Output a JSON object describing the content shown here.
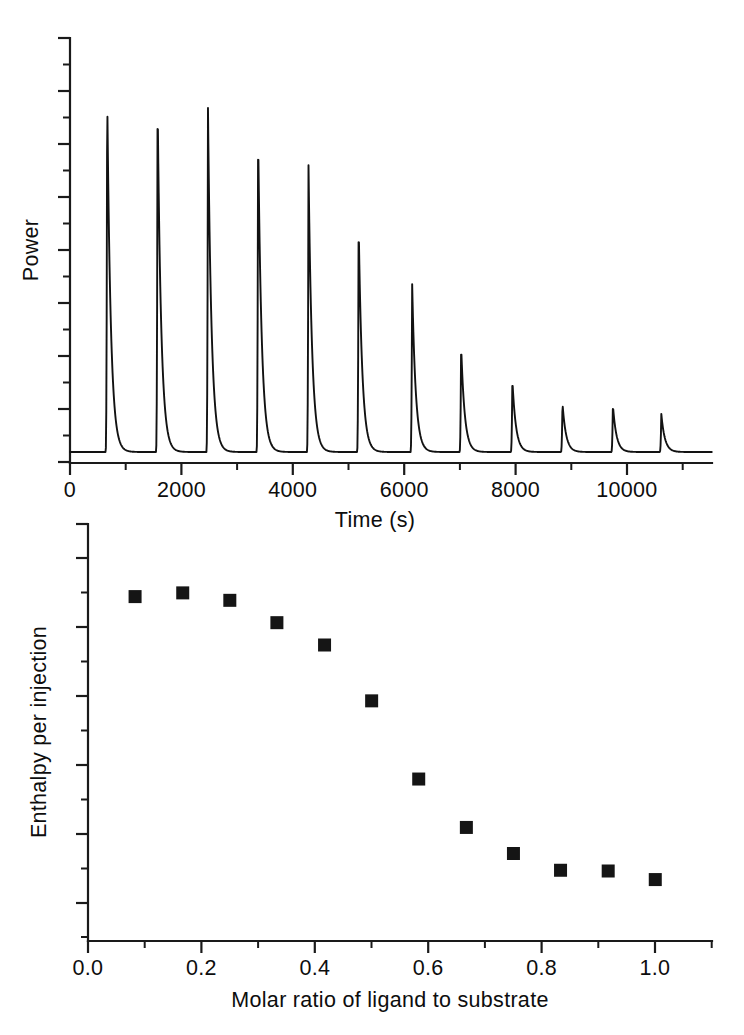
{
  "figure": {
    "type": "itc-thermogram-figure",
    "background_color": "#ffffff",
    "ink_color": "#121212"
  },
  "chart_data": [
    {
      "type": "line",
      "panel": "top",
      "title": "",
      "xlabel": "Time (s)",
      "ylabel": "Power",
      "xlim": [
        0,
        11400
      ],
      "ylim": [
        0,
        1.08
      ],
      "grid": false,
      "legend": "none",
      "x_ticks_major": [
        0,
        2000,
        4000,
        6000,
        8000,
        10000
      ],
      "x_tick_labels": [
        "0",
        "2000",
        "4000",
        "6000",
        "8000",
        "10000"
      ],
      "x_ticks_minor": [
        1000,
        3000,
        5000,
        7000,
        9000,
        11000
      ],
      "y_ticks_major_count": 9,
      "y_ticks_minor_count": 8,
      "y_tick_labels": [],
      "description": "Raw isothermal titration calorimetry thermogram: twelve exothermic injection peaks of decreasing amplitude on a flat baseline.",
      "series": [
        {
          "name": "power",
          "peak_times": [
            660,
            1555,
            2450,
            3340,
            4235,
            5125,
            6075,
            6945,
            7855,
            8745,
            9640,
            10500
          ],
          "peak_heights": [
            1.0,
            0.978,
            0.948,
            0.885,
            0.79,
            0.635,
            0.47,
            0.295,
            0.2,
            0.135,
            0.13,
            0.105
          ],
          "baseline": 0.0,
          "rise_time": 28,
          "decay_time": 150
        }
      ]
    },
    {
      "type": "scatter",
      "panel": "bottom",
      "title": "",
      "xlabel": "Molar ratio of ligand to substrate",
      "ylabel": "Enthalpy per injection",
      "xlim": [
        0.0,
        1.1
      ],
      "ylim": [
        0.0,
        1.12
      ],
      "grid": false,
      "legend": "none",
      "marker": "square",
      "x_ticks_major": [
        0.0,
        0.2,
        0.4,
        0.6,
        0.8,
        1.0
      ],
      "x_tick_labels": [
        "0.0",
        "0.2",
        "0.4",
        "0.6",
        "0.8",
        "1.0"
      ],
      "x_ticks_minor": [
        0.1,
        0.3,
        0.5,
        0.7,
        0.9,
        1.1
      ],
      "y_ticks_major_count": 6,
      "y_ticks_minor_count": 5,
      "y_tick_labels": [],
      "description": "Integrated binding isotherm: enthalpy per injection versus molar ratio, sigmoidal decay to saturation.",
      "x": [
        0.083,
        0.167,
        0.25,
        0.333,
        0.417,
        0.5,
        0.583,
        0.667,
        0.75,
        0.833,
        0.917,
        1.0
      ],
      "y": [
        0.925,
        0.935,
        0.915,
        0.855,
        0.795,
        0.645,
        0.435,
        0.305,
        0.235,
        0.19,
        0.188,
        0.165
      ]
    }
  ],
  "labels": {
    "top_panel": {
      "y_axis_title": "Power",
      "x_axis_title": "Time (s)",
      "x_tick_0": "0",
      "x_tick_1": "2000",
      "x_tick_2": "4000",
      "x_tick_3": "6000",
      "x_tick_4": "8000",
      "x_tick_5": "10000"
    },
    "bottom_panel": {
      "y_axis_title": "Enthalpy per injection",
      "x_axis_title": "Molar ratio of ligand to substrate",
      "x_tick_0": "0.0",
      "x_tick_1": "0.2",
      "x_tick_2": "0.4",
      "x_tick_3": "0.6",
      "x_tick_4": "0.8",
      "x_tick_5": "1.0"
    }
  }
}
